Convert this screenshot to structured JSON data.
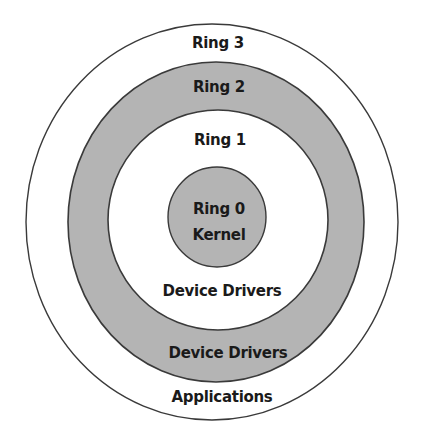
{
  "diagram": {
    "colors": {
      "background": "#ffffff",
      "shaded_ring": "#b4b4b4",
      "white_ring": "#ffffff",
      "stroke": "#3a3a3a",
      "text": "#1a1a1a"
    },
    "rings": [
      {
        "id": "ring3",
        "name": "Ring 3",
        "role": "Applications",
        "fill": "#ffffff"
      },
      {
        "id": "ring2",
        "name": "Ring 2",
        "role": "Device Drivers",
        "fill": "#b4b4b4"
      },
      {
        "id": "ring1",
        "name": "Ring 1",
        "role": "Device Drivers",
        "fill": "#ffffff"
      },
      {
        "id": "ring0",
        "name": "Ring 0",
        "role": "Kernel",
        "fill": "#b4b4b4"
      }
    ],
    "labels": {
      "ring3_name": "Ring 3",
      "ring2_name": "Ring 2",
      "ring1_name": "Ring 1",
      "ring0_name": "Ring 0",
      "ring0_role": "Kernel",
      "ring1_role": "Device Drivers",
      "ring2_role": "Device Drivers",
      "ring3_role": "Applications"
    }
  }
}
